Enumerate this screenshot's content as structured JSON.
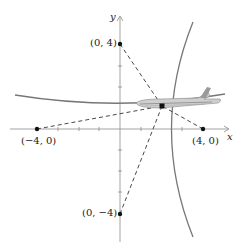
{
  "diagram": {
    "axes": {
      "x_label": "x",
      "y_label": "y"
    },
    "points": [
      {
        "id": "p_top",
        "label": "(0, 4)",
        "x": 0,
        "y": 4
      },
      {
        "id": "p_left",
        "label": "(−4, 0)",
        "x": -4,
        "y": 0
      },
      {
        "id": "p_right",
        "label": "(4, 0)",
        "x": 4,
        "y": 0
      },
      {
        "id": "p_bottom",
        "label": "(0, −4)",
        "x": 0,
        "y": -4
      },
      {
        "id": "aircraft",
        "label": "",
        "x": 2,
        "y": 1.1
      }
    ],
    "icons": {
      "aircraft": "airplane-icon"
    },
    "colors": {
      "curve": "#777777",
      "axis": "#888888",
      "dashed": "#333333",
      "point": "#111111"
    }
  }
}
